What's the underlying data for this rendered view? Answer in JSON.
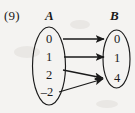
{
  "figure": {
    "number_label": "(9)",
    "type": "mapping-diagram",
    "background_color": "#f4f3f1",
    "ink_color": "#1a1a1a"
  },
  "sets": {
    "domain": {
      "label": "A",
      "elements": [
        "0",
        "1",
        "2",
        "–2"
      ]
    },
    "codomain": {
      "label": "B",
      "elements": [
        "0",
        "1",
        "4"
      ]
    }
  },
  "mappings": [
    {
      "from": "0",
      "to": "0",
      "style": "horizontal"
    },
    {
      "from": "1",
      "to": "1",
      "style": "horizontal"
    },
    {
      "from": "2",
      "to": "4",
      "style": "sloped-down"
    },
    {
      "from": "–2",
      "to": "4",
      "style": "sloped-up"
    }
  ]
}
